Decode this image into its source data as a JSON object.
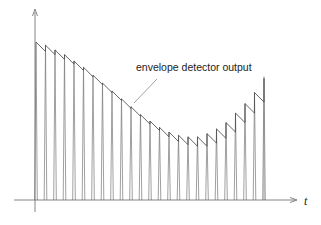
{
  "diagram": {
    "title": "",
    "annotation": "envelope detector output",
    "x_axis_label": "t",
    "y_axis_label": "",
    "line_color": "#555555",
    "pulse_color": "#777777"
  },
  "chart_data": {
    "type": "line",
    "title": "",
    "xlabel": "t",
    "ylabel": "",
    "pulse_count": 25,
    "pulse_peaks_normalized": [
      1.0,
      0.98,
      0.95,
      0.92,
      0.88,
      0.84,
      0.79,
      0.74,
      0.69,
      0.64,
      0.59,
      0.54,
      0.5,
      0.46,
      0.43,
      0.41,
      0.4,
      0.4,
      0.42,
      0.45,
      0.49,
      0.55,
      0.61,
      0.68,
      0.77
    ],
    "decay_fraction_between_pulses": 0.06,
    "ylim": [
      0,
      1.15
    ]
  }
}
